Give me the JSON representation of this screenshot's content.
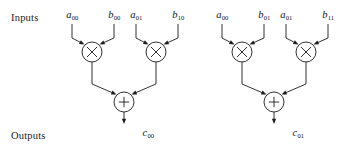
{
  "diagram": {
    "row_labels": {
      "inputs": "Inputs",
      "outputs": "Outputs"
    },
    "colors": {
      "stroke": "#1c1c1c",
      "background": "#ffffff",
      "text": "#141414"
    },
    "groups": [
      {
        "id": "left",
        "output": {
          "base": "c",
          "sub": "00",
          "x": 148
        },
        "adder": {
          "glyph": "+",
          "cx": 124,
          "cy": 102,
          "r": 10
        },
        "multipliers": [
          {
            "glyph": "×",
            "cx": 92,
            "cy": 52,
            "r": 10,
            "inputs": [
              {
                "base": "a",
                "sub": "00",
                "x": 72
              },
              {
                "base": "b",
                "sub": "00",
                "x": 114
              }
            ]
          },
          {
            "glyph": "×",
            "cx": 156,
            "cy": 52,
            "r": 10,
            "inputs": [
              {
                "base": "a",
                "sub": "01",
                "x": 136
              },
              {
                "base": "b",
                "sub": "10",
                "x": 178
              }
            ]
          }
        ]
      },
      {
        "id": "right",
        "output": {
          "base": "c",
          "sub": "01",
          "x": 298
        },
        "adder": {
          "glyph": "+",
          "cx": 274,
          "cy": 102,
          "r": 10
        },
        "multipliers": [
          {
            "glyph": "×",
            "cx": 242,
            "cy": 52,
            "r": 10,
            "inputs": [
              {
                "base": "a",
                "sub": "00",
                "x": 222
              },
              {
                "base": "b",
                "sub": "01",
                "x": 264
              }
            ]
          },
          {
            "glyph": "×",
            "cx": 306,
            "cy": 52,
            "r": 10,
            "inputs": [
              {
                "base": "a",
                "sub": "01",
                "x": 286
              },
              {
                "base": "b",
                "sub": "11",
                "x": 328
              }
            ]
          }
        ]
      }
    ]
  }
}
